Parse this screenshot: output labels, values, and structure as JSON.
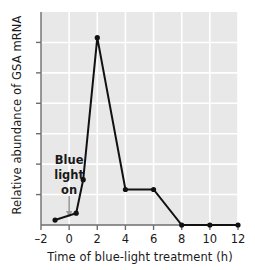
{
  "chart_data": {
    "type": "line",
    "title": "",
    "xlabel": "Time of blue-light treatment (h)",
    "ylabel": "Relative abundance of GSA mRNA",
    "xlim": [
      -2,
      12
    ],
    "ylim": [
      0,
      1.08
    ],
    "xticks": [
      -2,
      0,
      2,
      4,
      6,
      8,
      10,
      12
    ],
    "xtick_labels": [
      "–2",
      "0",
      "2",
      "4",
      "6",
      "8",
      "10",
      "12"
    ],
    "ytick_count": 6,
    "ytick_labels": [
      "",
      "",
      "",
      "",
      "",
      ""
    ],
    "grid": true,
    "legend": null,
    "series": [
      {
        "name": "GSA mRNA",
        "x": [
          -1,
          0.5,
          1,
          2,
          4,
          6,
          8,
          10,
          12
        ],
        "y": [
          0.025,
          0.06,
          0.23,
          0.95,
          0.18,
          0.18,
          0.0,
          0.0,
          0.0
        ]
      }
    ],
    "annotations": [
      {
        "name": "blue-light-on",
        "lines": [
          "Blue",
          "light",
          "on"
        ],
        "arrow_at_x": 0,
        "arrow_direction": "down"
      }
    ],
    "colors": {
      "plot_background": "#e8e8e8",
      "gridline": "#ffffff",
      "line": "#111111",
      "marker": "#111111",
      "axis": "#6e6e6e",
      "text": "#1a1a1a",
      "annotation_arrow": "#9a9a9a"
    }
  }
}
